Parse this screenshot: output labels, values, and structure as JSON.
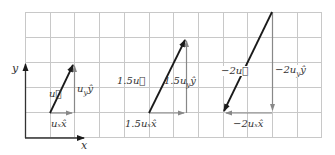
{
  "axes": {
    "x_label": "x",
    "y_label": "y"
  },
  "grid": {
    "columns": 12,
    "rows": 5,
    "cell_px": 24.7
  },
  "vectors": [
    {
      "name": "u",
      "label": "u⃗",
      "x_comp_label": "uₓx̂",
      "y_comp_label": "u_y ŷ",
      "dx": 1,
      "dy": 2
    },
    {
      "name": "1.5u",
      "label": "1.5u⃗",
      "x_comp_label": "1.5uₓx̂",
      "y_comp_label": "1.5u_y ŷ",
      "dx": 1.5,
      "dy": 3
    },
    {
      "name": "-2u",
      "label": "−2u⃗",
      "x_comp_label": "−2uₓx̂",
      "y_comp_label": "−2u_y ŷ",
      "dx": -2,
      "dy": -4
    }
  ],
  "labels": {
    "v1": "u⃗",
    "v1x": "uₓx̂",
    "v1y": "u",
    "v1y_sub": "y",
    "v1y_hat": "ŷ",
    "v2": "1.5u⃗",
    "v2x": "1.5uₓx̂",
    "v2y": "1.5u",
    "v2y_sub": "y",
    "v2y_hat": "ŷ",
    "v3": "−2u⃗",
    "v3x": "−2uₓx̂",
    "v3y": "−2u",
    "v3y_sub": "y",
    "v3y_hat": "ŷ"
  },
  "colors": {
    "grid": "#c8c8c8",
    "vector": "#1a1a1a",
    "component": "#888888",
    "axis": "#333333"
  }
}
